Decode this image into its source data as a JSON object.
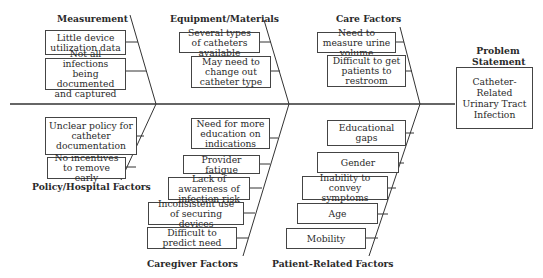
{
  "problem": {
    "title": "Problem Statement",
    "text": "Catheter-Related Urinary Tract Infection"
  },
  "categories": {
    "measurement": {
      "label": "Measurement",
      "causes": [
        "Little device utilization data",
        "Not all infections being documented and captured"
      ]
    },
    "equipment": {
      "label": "Equipment/Materials",
      "causes": [
        "Several types of catheters available",
        "May need to change out catheter type"
      ]
    },
    "care": {
      "label": "Care Factors",
      "causes": [
        "Need to measure urine volume",
        "Difficult to get patients to restroom"
      ]
    },
    "policy": {
      "label": "Policy/Hospital Factors",
      "causes": [
        "Unclear policy for catheter documentation",
        "No incentives to remove early"
      ]
    },
    "caregiver": {
      "label": "Caregiver Factors",
      "causes": [
        "Need for more education on indications",
        "Provider fatigue",
        "Lack of awareness of infection risk",
        "Inconsistent use of securing devices",
        "Difficult to predict need"
      ]
    },
    "patient": {
      "label": "Patient-Related Factors",
      "causes": [
        "Educational gaps",
        "Gender",
        "Inability to convey symptoms",
        "Age",
        "Mobility"
      ]
    }
  }
}
